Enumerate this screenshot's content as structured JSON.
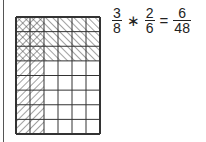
{
  "diagram": {
    "grid": {
      "columns": 6,
      "rows": 8
    },
    "regions": [
      {
        "name": "cross-hatched",
        "pattern": "cross",
        "col_start": 0,
        "col_end": 2,
        "row_start": 0,
        "row_end": 3
      },
      {
        "name": "backslash-hatched",
        "pattern": "backslash",
        "col_start": 2,
        "col_end": 6,
        "row_start": 0,
        "row_end": 3
      },
      {
        "name": "slash-hatched",
        "pattern": "slash",
        "col_start": 0,
        "col_end": 2,
        "row_start": 3,
        "row_end": 8
      }
    ],
    "colors": {
      "line": "#333333",
      "hatch": "#444444"
    }
  },
  "equation": {
    "frac1": {
      "num": "3",
      "den": "8"
    },
    "op1": "∗",
    "frac2": {
      "num": "2",
      "den": "6"
    },
    "op2": "=",
    "result": {
      "num": "6",
      "den": "48"
    }
  }
}
